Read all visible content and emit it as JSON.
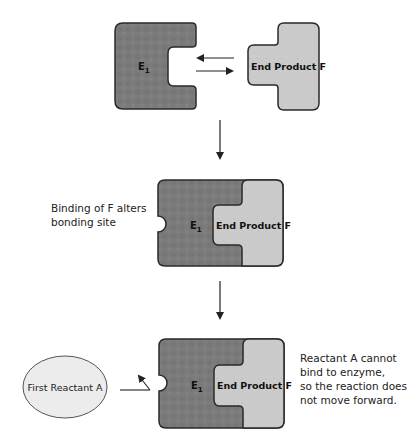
{
  "colors": {
    "enzyme_fill": "#7b7b7b",
    "enzyme_dot": "#6a6a6a",
    "product_fill": "#cbcbcb",
    "product_speck": "#b5b5b5",
    "reactant_fill": "#ececec",
    "stroke": "#2a2a2a"
  },
  "stage1": {
    "enzyme_label": "E",
    "enzyme_subscript": "1",
    "product_label": "End Product F"
  },
  "stage2": {
    "enzyme_label": "E",
    "enzyme_subscript": "1",
    "product_label": "End Product F",
    "caption_line1": "Binding of F alters",
    "caption_line2": "bonding site"
  },
  "stage3": {
    "enzyme_label": "E",
    "enzyme_subscript": "1",
    "product_label": "End Product F",
    "reactant_label": "First Reactant A",
    "caption_lines": [
      "Reactant A cannot",
      "bind to enzyme,",
      "so the reaction does",
      "not move forward."
    ]
  }
}
